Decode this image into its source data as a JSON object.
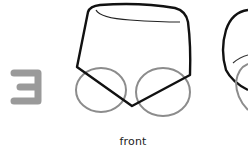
{
  "step": {
    "number": "3",
    "color": "#9a9a9a"
  },
  "views": [
    {
      "label": "front",
      "shape": "trapezoid-body-with-two-circles"
    },
    {
      "label": "",
      "shape": "side-view-partial"
    }
  ],
  "colors": {
    "outline": "#111111",
    "guide": "#8c8c8c",
    "background": "#ffffff"
  }
}
